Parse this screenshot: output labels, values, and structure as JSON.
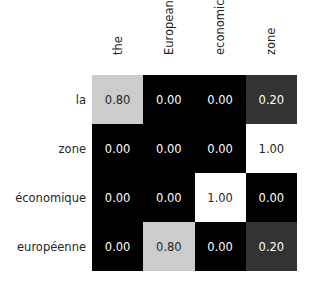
{
  "chart_data": {
    "type": "heatmap",
    "title": "",
    "xlabel": "",
    "ylabel": "",
    "x_labels": [
      "the",
      "European",
      "economic",
      "zone"
    ],
    "y_labels": [
      "la",
      "zone",
      "économique",
      "européenne"
    ],
    "values": [
      [
        0.8,
        0.0,
        0.0,
        0.2
      ],
      [
        0.0,
        0.0,
        0.0,
        1.0
      ],
      [
        0.0,
        0.0,
        1.0,
        0.0
      ],
      [
        0.0,
        0.8,
        0.0,
        0.2
      ]
    ],
    "value_labels": [
      [
        "0.80",
        "0.00",
        "0.00",
        "0.20"
      ],
      [
        "0.00",
        "0.00",
        "0.00",
        "1.00"
      ],
      [
        "0.00",
        "0.00",
        "1.00",
        "0.00"
      ],
      [
        "0.00",
        "0.80",
        "0.00",
        "0.20"
      ]
    ],
    "colormap": "gray",
    "vmin": 0,
    "vmax": 1,
    "x_tick_rotation": 90,
    "x_ticks_position": "top",
    "annotated": true,
    "colorbar": false,
    "grid": false
  }
}
